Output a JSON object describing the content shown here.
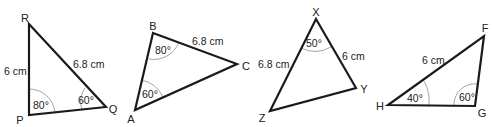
{
  "diagram": {
    "triangles": [
      {
        "name": "PQR",
        "vertices": {
          "R": "R",
          "P": "P",
          "Q": "Q"
        },
        "sides": {
          "PR": "6 cm",
          "RQ": "6.8 cm"
        },
        "angles": {
          "P": "80°",
          "Q": "60°"
        }
      },
      {
        "name": "ABC",
        "vertices": {
          "A": "A",
          "B": "B",
          "C": "C"
        },
        "sides": {
          "BC": "6.8 cm"
        },
        "angles": {
          "B": "80°",
          "A": "60°"
        }
      },
      {
        "name": "XYZ",
        "vertices": {
          "X": "X",
          "Y": "Y",
          "Z": "Z"
        },
        "sides": {
          "XZ": "6.8 cm",
          "XY": "6 cm"
        },
        "angles": {
          "X": "50°"
        }
      },
      {
        "name": "FGH",
        "vertices": {
          "F": "F",
          "G": "G",
          "H": "H"
        },
        "sides": {
          "HF": "6 cm"
        },
        "angles": {
          "H": "40°",
          "G": "60°"
        }
      }
    ]
  }
}
